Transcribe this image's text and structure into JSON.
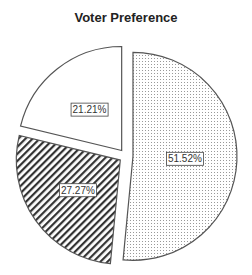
{
  "chart_data": {
    "type": "pie",
    "title": "Voter Preference",
    "slices": [
      {
        "label": "51.52%",
        "value": 51.52,
        "pattern": "dots"
      },
      {
        "label": "27.27%",
        "value": 27.27,
        "pattern": "diagonal-hatch"
      },
      {
        "label": "21.21%",
        "value": 21.21,
        "pattern": "none"
      }
    ],
    "exploded": true,
    "legend": "none"
  },
  "colors": {
    "stroke": "#555555",
    "background": "#ffffff"
  }
}
